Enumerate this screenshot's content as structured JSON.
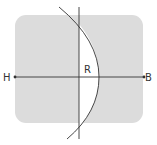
{
  "diagram": {
    "labels": {
      "left": "H",
      "right": "B",
      "region": "R"
    },
    "colors": {
      "background": "#ffffff",
      "panel": "#dcdcdc",
      "region": "#ffffff",
      "stroke": "#333333"
    },
    "elements": {
      "panel": "rounded-square-shaded",
      "horizontal_axis": "line H to B with endpoint dots",
      "vertical_line": "vertical line",
      "arc": "circular arc bulging right",
      "region_R": "unshaded region between vertical line and arc"
    }
  }
}
